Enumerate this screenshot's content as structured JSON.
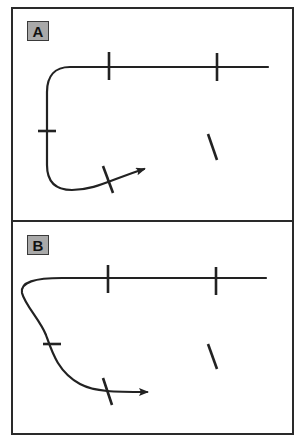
{
  "figure": {
    "panels": [
      {
        "label": "A",
        "description": "Path with right-angle turns: horizontal line bending down into a vertical segment, then curving right to an arrow",
        "tick_marks": 5,
        "arrow": true
      },
      {
        "label": "B",
        "description": "Path with a looping outward curve: horizontal line curling back left, then sweeping down and right to an arrow",
        "tick_marks": 5,
        "arrow": true
      }
    ],
    "colors": {
      "stroke": "#222222",
      "frame": "#2a2a2a",
      "label_fill": "#a9a9a9",
      "background": "#ffffff"
    }
  }
}
